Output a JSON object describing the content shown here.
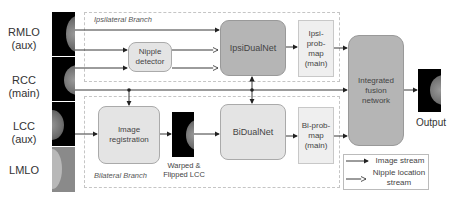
{
  "inputs": [
    {
      "name": "RMLO",
      "sub": "(aux)"
    },
    {
      "name": "RCC",
      "sub": "(main)"
    },
    {
      "name": "LCC",
      "sub": "(aux)"
    },
    {
      "name": "LMLO",
      "sub": ""
    }
  ],
  "branches": {
    "ipsilateral": "Ipsilateral Branch",
    "bilateral": "Bilateral Branch"
  },
  "nodes": {
    "nipple_detector": "Nipple detector",
    "ipsi_dual_net": "IpsiDualNet",
    "image_registration": "Image registration",
    "warped_caption": "Warped & Flipped LCC",
    "bi_dual_net": "BiDualNet",
    "ipsi_prob_map": "Ipsi-prob-map (main)",
    "bi_prob_map": "Bi-prob-map (main)",
    "fusion": "Integrated fusion network",
    "output": "Output"
  },
  "legend": {
    "image_stream": "Image stream",
    "nipple_stream": "Nipple location stream"
  },
  "colors": {
    "light_box": "#e4e4e4",
    "dark_box": "#b5b5b5",
    "prob_box": "#efefef",
    "arrow": "#222222"
  }
}
